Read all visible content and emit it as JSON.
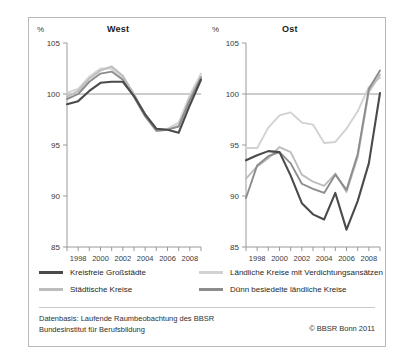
{
  "figure": {
    "panels": [
      {
        "key": "west",
        "label": "West",
        "unit": "%"
      },
      {
        "key": "ost",
        "label": "Ost",
        "unit": "%"
      }
    ],
    "legend": [
      {
        "label": "Kreisfreie Großstädte",
        "color": "#4a4a4a"
      },
      {
        "label": "Ländliche Kreise mit Verdichtungsansätzen",
        "color": "#d2d2d2"
      },
      {
        "label": "Städtische Kreise",
        "color": "#bdbdbd"
      },
      {
        "label": "Dünn besiedelte ländliche Kreise",
        "color": "#8c8c8c"
      }
    ],
    "source_line_1": "Datenbasis: Laufende Raumbeobachtung des BBSR",
    "source_line_2": "Bundesinstitut für Berufsbildung",
    "copyright": "© BBSR Bonn 2011"
  },
  "chart_data": [
    {
      "type": "line",
      "title": "West",
      "xlabel": "",
      "ylabel": "%",
      "ylim": [
        85,
        105
      ],
      "yticks": [
        85,
        90,
        95,
        100,
        105
      ],
      "xlim": [
        1997,
        2009
      ],
      "x": [
        1997,
        1998,
        1999,
        2000,
        2001,
        2002,
        2003,
        2004,
        2005,
        2006,
        2007,
        2008,
        2009
      ],
      "xticks": [
        1998,
        2000,
        2002,
        2004,
        2006,
        2008
      ],
      "grid": false,
      "reference_line": 100,
      "series": [
        {
          "name": "Kreisfreie Großstädte",
          "color": "#4a4a4a",
          "values": [
            99.0,
            99.3,
            100.3,
            101.1,
            101.2,
            101.2,
            99.8,
            98.0,
            96.6,
            96.5,
            96.2,
            98.9,
            101.4
          ]
        },
        {
          "name": "Ländliche Kreise mit Verdichtungsansätzen",
          "color": "#d2d2d2",
          "values": [
            100.1,
            100.5,
            101.7,
            102.5,
            102.5,
            101.6,
            100.0,
            98.0,
            96.5,
            96.6,
            97.2,
            99.9,
            102.0
          ]
        },
        {
          "name": "Städtische Kreise",
          "color": "#bdbdbd",
          "values": [
            99.7,
            100.3,
            101.5,
            102.3,
            102.7,
            101.8,
            100.0,
            97.9,
            96.4,
            96.5,
            96.9,
            99.6,
            101.7
          ]
        },
        {
          "name": "Dünn besiedelte ländliche Kreise",
          "color": "#8c8c8c",
          "values": [
            99.5,
            100.0,
            101.2,
            102.0,
            102.2,
            101.4,
            99.7,
            97.8,
            96.4,
            96.5,
            96.8,
            99.4,
            101.6
          ]
        }
      ]
    },
    {
      "type": "line",
      "title": "Ost",
      "xlabel": "",
      "ylabel": "%",
      "ylim": [
        85,
        105
      ],
      "yticks": [
        85,
        90,
        95,
        100,
        105
      ],
      "xlim": [
        1997,
        2009
      ],
      "x": [
        1997,
        1998,
        1999,
        2000,
        2001,
        2002,
        2003,
        2004,
        2005,
        2006,
        2007,
        2008,
        2009
      ],
      "xticks": [
        1998,
        2000,
        2002,
        2004,
        2006,
        2008
      ],
      "grid": false,
      "reference_line": 100,
      "series": [
        {
          "name": "Kreisfreie Großstädte",
          "color": "#4a4a4a",
          "values": [
            93.5,
            94.0,
            94.4,
            94.3,
            92.0,
            89.3,
            88.2,
            87.7,
            90.3,
            86.7,
            89.5,
            93.2,
            100.1
          ]
        },
        {
          "name": "Ländliche Kreise mit Verdichtungsansätzen",
          "color": "#d2d2d2",
          "values": [
            94.7,
            94.7,
            96.7,
            97.9,
            98.2,
            97.2,
            97.0,
            95.2,
            95.3,
            96.6,
            98.3,
            100.7,
            101.6
          ]
        },
        {
          "name": "Städtische Kreise",
          "color": "#bdbdbd",
          "values": [
            91.7,
            92.9,
            93.7,
            94.8,
            94.3,
            92.1,
            91.4,
            91.0,
            92.2,
            90.4,
            93.8,
            100.2,
            101.9
          ]
        },
        {
          "name": "Dünn besiedelte ländliche Kreise",
          "color": "#8c8c8c",
          "values": [
            89.8,
            93.0,
            93.9,
            94.3,
            93.2,
            91.2,
            90.7,
            90.3,
            92.1,
            90.6,
            94.1,
            100.5,
            102.3
          ]
        }
      ]
    }
  ]
}
